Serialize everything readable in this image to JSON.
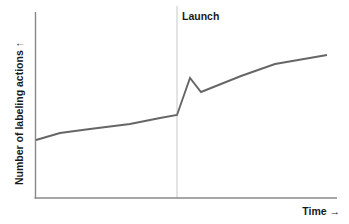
{
  "figure": {
    "width": 349,
    "height": 224,
    "background": "#ffffff"
  },
  "labels": {
    "ylabel": "Number of labeling actions ↑",
    "xlabel": "Time →",
    "launch_annotation": "Launch"
  },
  "colors": {
    "line": "#666666",
    "axis": "#888888",
    "annotation_line": "#dcdcdc",
    "text": "#1a1a1a"
  },
  "chart_data": {
    "type": "line",
    "title": "",
    "xlabel": "Time →",
    "ylabel": "Number of labeling actions ↑",
    "grid": false,
    "legend": null,
    "xlim": [
      0,
      100
    ],
    "ylim": [
      0,
      100
    ],
    "axis_ticks": {
      "x": [],
      "y": []
    },
    "annotations": [
      {
        "text": "Launch",
        "type": "vertical-line",
        "x": 47,
        "label_x": 49,
        "label_y": 96,
        "line_color": "#dcdcdc"
      }
    ],
    "series": [
      {
        "name": "Number of labeling actions",
        "color": "#666666",
        "line_width": 1.8,
        "x": [
          0,
          16,
          32,
          47,
          47,
          52,
          56,
          68,
          81,
          97
        ],
        "y": [
          31,
          37,
          40,
          45,
          45,
          64,
          57,
          67,
          76,
          77
        ],
        "points": [
          {
            "x": 0,
            "y": 31,
            "note": "start"
          },
          {
            "x": 16,
            "y": 37,
            "note": "gentle rise"
          },
          {
            "x": 32,
            "y": 40,
            "note": "gentle rise"
          },
          {
            "x": 47,
            "y": 45,
            "note": "pre-launch level"
          },
          {
            "x": 52,
            "y": 64,
            "note": "post-launch spike peak"
          },
          {
            "x": 56,
            "y": 57,
            "note": "spike settles / dip"
          },
          {
            "x": 68,
            "y": 67,
            "note": "steady growth"
          },
          {
            "x": 81,
            "y": 76,
            "note": "steady growth"
          },
          {
            "x": 97,
            "y": 77,
            "note": "end"
          }
        ]
      }
    ]
  },
  "geometry": {
    "axis": {
      "origin_x": 35,
      "origin_y": 198,
      "y_top": 12,
      "x_right": 337
    },
    "launch_x": 177,
    "polyline_points": "36,140 60,133 90,129 130,124 160,118 177,115 190,78 201,92 241,76 275,64 327,55"
  }
}
